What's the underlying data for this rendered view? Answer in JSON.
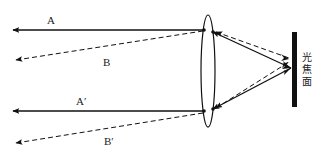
{
  "diagram": {
    "type": "optics-ray-diagram",
    "labels": {
      "ray_a": "A",
      "ray_b": "B",
      "ray_a_prime": "A′",
      "ray_b_prime": "B′",
      "focal_plane": [
        "光",
        "焦",
        "面"
      ]
    },
    "elements": {
      "lens": "convex lens (ellipse)",
      "focal_plane": "focal plane (black bar)",
      "solid_rays": [
        "A",
        "A′"
      ],
      "dashed_rays": [
        "B",
        "B′"
      ]
    },
    "colors": {
      "line": "#111111",
      "background": "#ffffff"
    }
  }
}
